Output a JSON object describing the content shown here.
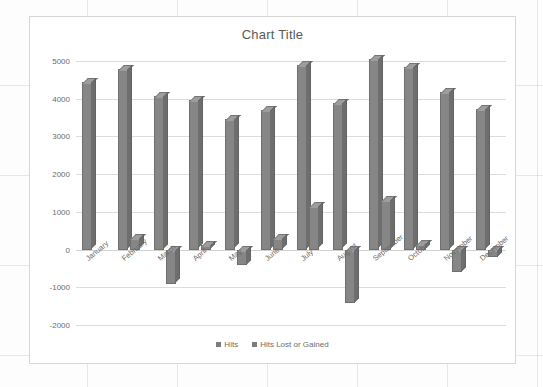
{
  "chart_data": {
    "type": "bar",
    "title": "Chart Title",
    "xlabel": "",
    "ylabel": "",
    "ylim": [
      -2000,
      5000
    ],
    "ytick_step": 1000,
    "yticks": [
      "5000",
      "4000",
      "3000",
      "2000",
      "1000",
      "0",
      "-1000",
      "-2000"
    ],
    "grid": true,
    "legend_position": "bottom",
    "categories": [
      "January",
      "February",
      "March",
      "April",
      "May",
      "June",
      "July",
      "August",
      "September",
      "October",
      "November",
      "December"
    ],
    "series": [
      {
        "name": "Hits",
        "color": "#868686",
        "values": [
          4450,
          4800,
          4080,
          3960,
          3450,
          3700,
          4900,
          3880,
          5050,
          4850,
          4180,
          3730
        ]
      },
      {
        "name": "Hits Lost or Gained",
        "color": "#868686",
        "values": [
          0,
          300,
          -900,
          120,
          -420,
          320,
          1150,
          -1420,
          1320,
          150,
          -600,
          -200
        ]
      }
    ]
  },
  "legend": {
    "items": [
      {
        "label": "Hits"
      },
      {
        "label": "Hits Lost or Gained"
      }
    ]
  }
}
